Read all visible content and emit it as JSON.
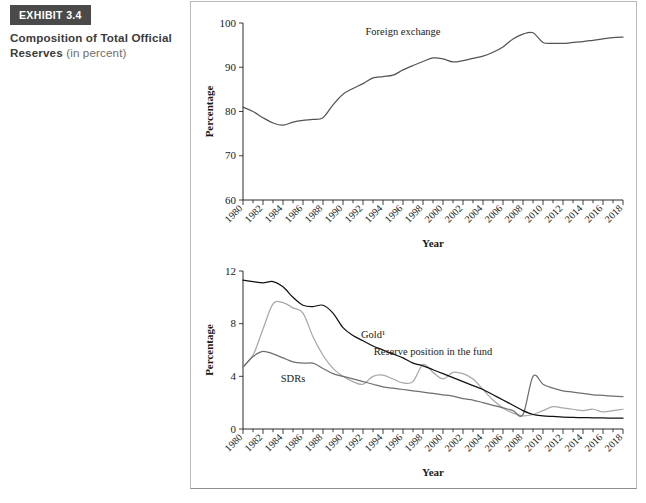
{
  "exhibit": {
    "badge": "EXHIBIT 3.4",
    "title_bold": "Composition of Total Official Reserves ",
    "title_light": "(in percent)"
  },
  "chart_data": [
    {
      "id": "foreign-exchange-chart",
      "type": "line",
      "title": "",
      "xlabel": "Year",
      "ylabel": "Percentage",
      "ylim": [
        60,
        100
      ],
      "yticks": [
        60,
        70,
        80,
        90,
        100
      ],
      "xlim": [
        1980,
        2018
      ],
      "xticks": [
        1980,
        1982,
        1984,
        1986,
        1988,
        1990,
        1992,
        1994,
        1996,
        1998,
        2000,
        2002,
        2004,
        2006,
        2008,
        2010,
        2012,
        2014,
        2016,
        2018
      ],
      "grid": false,
      "legend": "inline-annotation",
      "annotations": [
        {
          "text": "Foreign exchange",
          "x": 1996,
          "y": 97.2
        }
      ],
      "series": [
        {
          "name": "Foreign exchange",
          "color": "#555555",
          "x": [
            1980,
            1981,
            1982,
            1983,
            1984,
            1985,
            1986,
            1987,
            1988,
            1989,
            1990,
            1991,
            1992,
            1993,
            1994,
            1995,
            1996,
            1997,
            1998,
            1999,
            2000,
            2001,
            2002,
            2003,
            2004,
            2005,
            2006,
            2007,
            2008,
            2009,
            2010,
            2011,
            2012,
            2013,
            2014,
            2015,
            2016,
            2017,
            2018
          ],
          "values": [
            81.0,
            80.0,
            78.6,
            77.4,
            76.9,
            77.6,
            78.0,
            78.2,
            78.6,
            81.5,
            83.9,
            85.2,
            86.3,
            87.6,
            87.9,
            88.2,
            89.4,
            90.4,
            91.3,
            92.1,
            91.9,
            91.2,
            91.5,
            92.0,
            92.5,
            93.4,
            94.6,
            96.4,
            97.5,
            97.8,
            95.6,
            95.4,
            95.4,
            95.6,
            95.8,
            96.1,
            96.4,
            96.7,
            96.8
          ]
        }
      ]
    },
    {
      "id": "reserves-composition-chart",
      "type": "line",
      "title": "",
      "xlabel": "Year",
      "ylabel": "Percentage",
      "ylim": [
        0,
        12
      ],
      "yticks": [
        0,
        4,
        8,
        12
      ],
      "xlim": [
        1980,
        2018
      ],
      "xticks": [
        1980,
        1982,
        1984,
        1986,
        1988,
        1990,
        1992,
        1994,
        1996,
        1998,
        2000,
        2002,
        2004,
        2006,
        2008,
        2010,
        2012,
        2014,
        2016,
        2018
      ],
      "grid": false,
      "legend": "inline-annotation",
      "annotations": [
        {
          "text": "Gold¹",
          "x": 1993,
          "y": 6.9
        },
        {
          "text": "SDRs",
          "x": 1985,
          "y": 3.6
        },
        {
          "text": "Reserve position in the fund",
          "x": 1999,
          "y": 5.6
        }
      ],
      "series": [
        {
          "name": "Gold",
          "color": "#111111",
          "x": [
            1980,
            1981,
            1982,
            1983,
            1984,
            1985,
            1986,
            1987,
            1988,
            1989,
            1990,
            1991,
            1992,
            1993,
            1994,
            1995,
            1996,
            1997,
            1998,
            1999,
            2000,
            2001,
            2002,
            2003,
            2004,
            2005,
            2006,
            2007,
            2008,
            2009,
            2010,
            2011,
            2012,
            2013,
            2014,
            2015,
            2016,
            2017,
            2018
          ],
          "values": [
            11.3,
            11.2,
            11.1,
            11.2,
            10.8,
            10.0,
            9.4,
            9.3,
            9.4,
            8.8,
            7.7,
            7.1,
            6.7,
            6.3,
            6.0,
            5.7,
            5.4,
            5.0,
            4.8,
            4.5,
            4.2,
            3.9,
            3.6,
            3.3,
            3.0,
            2.6,
            2.2,
            1.8,
            1.4,
            1.1,
            1.0,
            0.95,
            0.9,
            0.88,
            0.86,
            0.85,
            0.84,
            0.83,
            0.82
          ]
        },
        {
          "name": "Reserve position in the fund",
          "color": "#a8a8a8",
          "x": [
            1980,
            1981,
            1982,
            1983,
            1984,
            1985,
            1986,
            1987,
            1988,
            1989,
            1990,
            1991,
            1992,
            1993,
            1994,
            1995,
            1996,
            1997,
            1998,
            1999,
            2000,
            2001,
            2002,
            2003,
            2004,
            2005,
            2006,
            2007,
            2008,
            2009,
            2010,
            2011,
            2012,
            2013,
            2014,
            2015,
            2016,
            2017,
            2018
          ],
          "values": [
            4.7,
            5.6,
            7.6,
            9.5,
            9.6,
            9.2,
            8.8,
            7.0,
            5.6,
            4.6,
            4.0,
            3.6,
            3.4,
            4.0,
            4.1,
            3.8,
            3.5,
            3.6,
            4.9,
            4.3,
            3.8,
            4.3,
            4.2,
            3.8,
            3.0,
            2.2,
            1.6,
            1.2,
            1.0,
            1.1,
            1.4,
            1.7,
            1.6,
            1.5,
            1.4,
            1.5,
            1.3,
            1.4,
            1.5
          ]
        },
        {
          "name": "SDRs",
          "color": "#6f6f6f",
          "x": [
            1980,
            1981,
            1982,
            1983,
            1984,
            1985,
            1986,
            1987,
            1988,
            1989,
            1990,
            1991,
            1992,
            1993,
            1994,
            1995,
            1996,
            1997,
            1998,
            1999,
            2000,
            2001,
            2002,
            2003,
            2004,
            2005,
            2006,
            2007,
            2008,
            2009,
            2010,
            2011,
            2012,
            2013,
            2014,
            2015,
            2016,
            2017,
            2018
          ],
          "values": [
            4.7,
            5.5,
            5.9,
            5.7,
            5.4,
            5.1,
            5.0,
            5.0,
            4.6,
            4.2,
            4.0,
            3.8,
            3.6,
            3.4,
            3.2,
            3.1,
            3.0,
            2.9,
            2.8,
            2.7,
            2.6,
            2.5,
            2.3,
            2.2,
            2.0,
            1.8,
            1.6,
            1.4,
            1.1,
            4.0,
            3.4,
            3.1,
            2.9,
            2.8,
            2.7,
            2.6,
            2.55,
            2.5,
            2.45
          ]
        }
      ]
    }
  ]
}
